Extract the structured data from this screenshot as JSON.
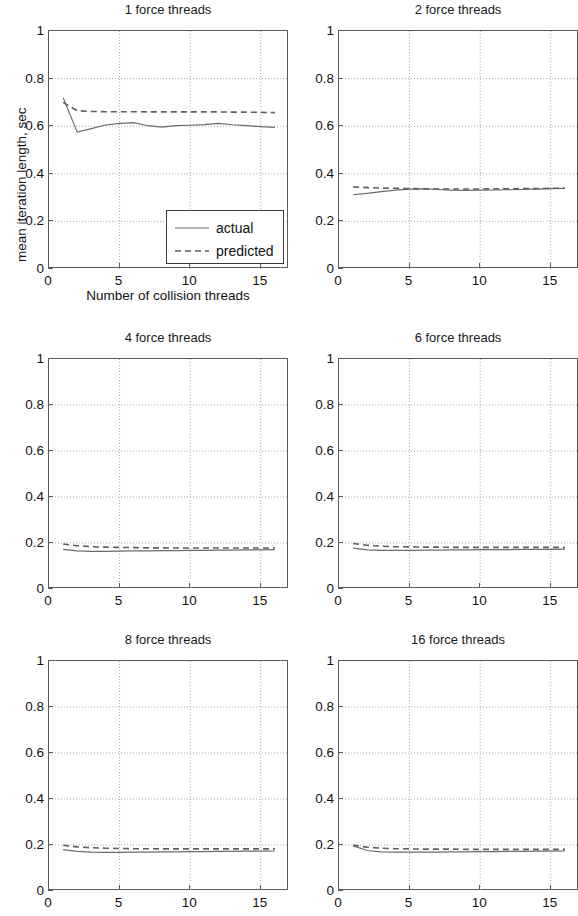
{
  "figure": {
    "width": 578,
    "height": 916,
    "background": "#ffffff",
    "line_color_actual": "#6b6b6b",
    "line_color_predicted": "#5f5f5f",
    "axis_color": "#5a5a5a",
    "grid_color": "#aaaaaa"
  },
  "axis_label": {
    "y": "mean iteration length, sec",
    "x": "Number of collision threads"
  },
  "legend": {
    "items": [
      {
        "label": "actual",
        "style": "solid"
      },
      {
        "label": "predicted",
        "style": "dashed"
      }
    ]
  },
  "ticks": {
    "y": [
      "0",
      "0.2",
      "0.4",
      "0.6",
      "0.8",
      "1"
    ],
    "y_values": [
      0,
      0.2,
      0.4,
      0.6,
      0.8,
      1
    ],
    "x": [
      "0",
      "5",
      "10",
      "15"
    ],
    "x_values": [
      0,
      5,
      10,
      15
    ]
  },
  "chart_data": {
    "type": "line",
    "xlabel": "Number of collision threads",
    "ylabel": "mean iteration length, sec",
    "xlim": [
      0,
      17
    ],
    "ylim": [
      0,
      1
    ],
    "grid": true,
    "legend_position": "lower right of first subplot",
    "legend_entries": [
      "actual",
      "predicted"
    ],
    "x": [
      1,
      2,
      3,
      4,
      5,
      6,
      7,
      8,
      9,
      10,
      11,
      12,
      13,
      14,
      15,
      16
    ],
    "panels": [
      {
        "title": "1 force threads",
        "row": 0,
        "col": 0,
        "has_legend": true,
        "series": [
          {
            "name": "actual",
            "style": "solid",
            "values": [
              0.72,
              0.575,
              0.59,
              0.605,
              0.612,
              0.615,
              0.602,
              0.596,
              0.602,
              0.604,
              0.607,
              0.612,
              0.606,
              0.602,
              0.598,
              0.595
            ]
          },
          {
            "name": "predicted",
            "style": "dashed",
            "values": [
              0.7,
              0.665,
              0.662,
              0.661,
              0.661,
              0.661,
              0.66,
              0.66,
              0.66,
              0.66,
              0.66,
              0.66,
              0.659,
              0.659,
              0.658,
              0.657
            ]
          }
        ]
      },
      {
        "title": "2 force threads",
        "row": 0,
        "col": 1,
        "has_legend": false,
        "series": [
          {
            "name": "actual",
            "style": "solid",
            "values": [
              0.312,
              0.318,
              0.325,
              0.331,
              0.336,
              0.337,
              0.334,
              0.331,
              0.33,
              0.331,
              0.332,
              0.333,
              0.334,
              0.336,
              0.338,
              0.339
            ]
          },
          {
            "name": "predicted",
            "style": "dashed",
            "values": [
              0.345,
              0.342,
              0.34,
              0.339,
              0.338,
              0.337,
              0.336,
              0.336,
              0.336,
              0.336,
              0.337,
              0.337,
              0.338,
              0.338,
              0.339,
              0.34
            ]
          }
        ]
      },
      {
        "title": "4 force threads",
        "row": 1,
        "col": 0,
        "has_legend": false,
        "series": [
          {
            "name": "actual",
            "style": "solid",
            "values": [
              0.172,
              0.166,
              0.164,
              0.164,
              0.165,
              0.166,
              0.166,
              0.167,
              0.167,
              0.168,
              0.168,
              0.169,
              0.169,
              0.17,
              0.17,
              0.171
            ]
          },
          {
            "name": "predicted",
            "style": "dashed",
            "values": [
              0.196,
              0.188,
              0.184,
              0.182,
              0.181,
              0.18,
              0.179,
              0.179,
              0.178,
              0.178,
              0.178,
              0.178,
              0.178,
              0.178,
              0.178,
              0.178
            ]
          }
        ]
      },
      {
        "title": "6 force threads",
        "row": 1,
        "col": 1,
        "has_legend": false,
        "series": [
          {
            "name": "actual",
            "style": "solid",
            "values": [
              0.178,
              0.17,
              0.168,
              0.168,
              0.168,
              0.169,
              0.169,
              0.17,
              0.17,
              0.171,
              0.171,
              0.171,
              0.172,
              0.172,
              0.172,
              0.173
            ]
          },
          {
            "name": "predicted",
            "style": "dashed",
            "values": [
              0.198,
              0.19,
              0.186,
              0.184,
              0.183,
              0.182,
              0.182,
              0.181,
              0.181,
              0.181,
              0.181,
              0.181,
              0.181,
              0.181,
              0.181,
              0.181
            ]
          }
        ]
      },
      {
        "title": "8 force threads",
        "row": 2,
        "col": 0,
        "has_legend": false,
        "series": [
          {
            "name": "actual",
            "style": "solid",
            "values": [
              0.18,
              0.172,
              0.169,
              0.168,
              0.168,
              0.169,
              0.169,
              0.17,
              0.17,
              0.171,
              0.171,
              0.172,
              0.172,
              0.173,
              0.173,
              0.174
            ]
          },
          {
            "name": "predicted",
            "style": "dashed",
            "values": [
              0.199,
              0.192,
              0.188,
              0.186,
              0.185,
              0.184,
              0.184,
              0.183,
              0.183,
              0.183,
              0.183,
              0.183,
              0.183,
              0.183,
              0.183,
              0.183
            ]
          }
        ]
      },
      {
        "title": "16 force threads",
        "row": 2,
        "col": 1,
        "has_legend": false,
        "series": [
          {
            "name": "actual",
            "style": "solid",
            "values": [
              0.196,
              0.176,
              0.17,
              0.169,
              0.169,
              0.169,
              0.169,
              0.17,
              0.17,
              0.171,
              0.171,
              0.172,
              0.172,
              0.173,
              0.173,
              0.174
            ]
          },
          {
            "name": "predicted",
            "style": "dashed",
            "values": [
              0.2,
              0.19,
              0.186,
              0.184,
              0.183,
              0.182,
              0.182,
              0.182,
              0.181,
              0.181,
              0.181,
              0.181,
              0.181,
              0.181,
              0.181,
              0.181
            ]
          }
        ]
      }
    ]
  }
}
